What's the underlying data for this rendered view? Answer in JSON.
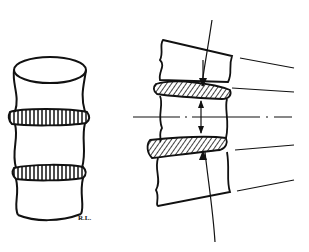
{
  "diagram": {
    "left_figure": {
      "label": "vertebral-column-3d",
      "vertebrae": 3,
      "discs": 2
    },
    "right_figure": {
      "label": "vertebral-column-lateral",
      "vertebrae": 3,
      "discs": 2,
      "annotation_lines": 4,
      "axis": "dash-dot horizontal axis",
      "arrows": "compression arrows toward discs"
    },
    "signature": "R.L.",
    "colors": {
      "ink": "#111111",
      "background": "#ffffff"
    }
  }
}
